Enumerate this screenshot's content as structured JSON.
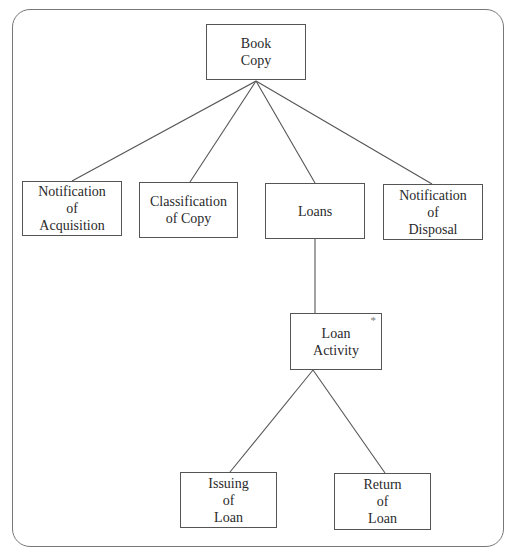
{
  "diagram": {
    "type": "structure-chart",
    "nodes": [
      {
        "id": "book_copy",
        "lines": [
          "Book",
          "Copy"
        ],
        "x": 206,
        "y": 24,
        "w": 100,
        "h": 56
      },
      {
        "id": "notification_acquisition",
        "lines": [
          "Notification",
          "of",
          "Acquisition"
        ],
        "x": 22,
        "y": 181,
        "w": 100,
        "h": 55
      },
      {
        "id": "classification_copy",
        "lines": [
          "Classification",
          "of Copy"
        ],
        "x": 139,
        "y": 182,
        "w": 99,
        "h": 56
      },
      {
        "id": "loans",
        "lines": [
          "Loans"
        ],
        "x": 265,
        "y": 183,
        "w": 100,
        "h": 56
      },
      {
        "id": "notification_disposal",
        "lines": [
          "Notification",
          "of",
          "Disposal"
        ],
        "x": 383,
        "y": 184,
        "w": 100,
        "h": 56
      },
      {
        "id": "loan_activity",
        "lines": [
          "Loan",
          "Activity"
        ],
        "x": 290,
        "y": 313,
        "w": 92,
        "h": 57,
        "marker": "*"
      },
      {
        "id": "issuing_loan",
        "lines": [
          "Issuing",
          "of",
          "Loan"
        ],
        "x": 180,
        "y": 472,
        "w": 97,
        "h": 56
      },
      {
        "id": "return_loan",
        "lines": [
          "Return",
          "of",
          "Loan"
        ],
        "x": 334,
        "y": 473,
        "w": 97,
        "h": 57
      }
    ],
    "edges": [
      {
        "from": "book_copy",
        "to": "notification_acquisition",
        "x1": 256,
        "y1": 81,
        "x2": 72,
        "y2": 181
      },
      {
        "from": "book_copy",
        "to": "classification_copy",
        "x1": 256,
        "y1": 81,
        "x2": 190,
        "y2": 182
      },
      {
        "from": "book_copy",
        "to": "loans",
        "x1": 256,
        "y1": 81,
        "x2": 315,
        "y2": 183
      },
      {
        "from": "book_copy",
        "to": "notification_disposal",
        "x1": 256,
        "y1": 81,
        "x2": 432,
        "y2": 184
      },
      {
        "from": "loans",
        "to": "loan_activity",
        "x1": 315,
        "y1": 239,
        "x2": 315,
        "y2": 313
      },
      {
        "from": "loan_activity",
        "to": "issuing_loan",
        "x1": 313,
        "y1": 370,
        "x2": 230,
        "y2": 472
      },
      {
        "from": "loan_activity",
        "to": "return_loan",
        "x1": 313,
        "y1": 370,
        "x2": 385,
        "y2": 473
      }
    ],
    "colors": {
      "line": "#555555",
      "frame": "#777777",
      "text": "#2a2a2a"
    }
  }
}
